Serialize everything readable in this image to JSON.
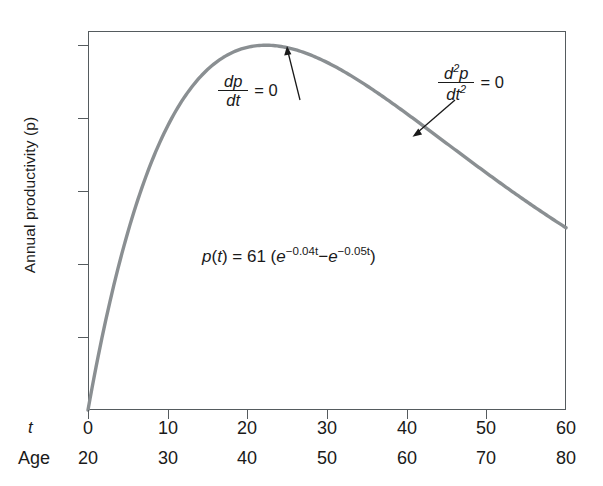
{
  "chart_data": {
    "type": "line",
    "title": "",
    "equation_text": "p(t) = 61 (e^-0.04t - e^-0.05t)",
    "function": "p(t) = 61 (e^(-0.04t) - e^(-0.05t))",
    "ylabel": "Annual productivity (p)",
    "xlabel": "t",
    "secondary_xlabel": "Age",
    "xlim": [
      0,
      60
    ],
    "ylim": [
      0,
      5.3
    ],
    "grid": false,
    "legend": "none",
    "xticks": [
      0,
      10,
      20,
      30,
      40,
      50,
      60
    ],
    "xtick_labels": [
      "0",
      "10",
      "20",
      "30",
      "40",
      "50",
      "60"
    ],
    "secondary_xtick_labels": [
      "20",
      "30",
      "40",
      "50",
      "60",
      "70",
      "80"
    ],
    "yticks": [
      0,
      1,
      2,
      3,
      4,
      5
    ],
    "ytick_labels": [
      "0",
      "1",
      "2",
      "3",
      "4",
      "5"
    ],
    "series": [
      {
        "name": "p(t)",
        "color": "#8a8f92",
        "x": [
          0,
          1,
          2,
          3,
          4,
          5,
          6,
          8,
          10,
          12,
          14,
          16,
          18,
          20,
          22,
          22.31,
          24,
          26,
          28,
          30,
          32,
          34,
          36,
          38,
          40,
          42,
          44,
          46,
          48,
          50,
          52,
          54,
          56,
          58,
          60
        ],
        "values": [
          0,
          0.58,
          1.12,
          1.62,
          2.08,
          2.5,
          2.89,
          3.57,
          4.13,
          4.57,
          4.91,
          5.16,
          5.33,
          5.44,
          5.49,
          5.49,
          5.48,
          5.44,
          5.36,
          5.25,
          5.12,
          4.97,
          4.81,
          4.64,
          4.46,
          4.28,
          4.09,
          3.9,
          3.71,
          3.53,
          3.34,
          3.16,
          2.99,
          2.82,
          2.66
        ]
      }
    ],
    "key_points": {
      "maximum": {
        "t": 22.3,
        "p": 5.0,
        "label": "dp/dt = 0"
      },
      "inflection": {
        "t": 44.6,
        "p": 4.0,
        "label": "d2p/dt2 = 0"
      },
      "start": {
        "t": 0,
        "p": 0
      },
      "end": {
        "t": 60,
        "p": 2.47
      }
    },
    "annotations": [
      {
        "id": "first-derivative",
        "numerator": "dp",
        "denominator": "dt",
        "numerator_exponent": "",
        "denominator_exponent": "",
        "equals": "= 0"
      },
      {
        "id": "second-derivative",
        "numerator": "d",
        "denominator": "dt",
        "numerator_exponent": "2",
        "numerator_tail": "p",
        "denominator_exponent": "2",
        "equals": "= 0"
      }
    ],
    "equation_parts": {
      "lhs_p": "p",
      "lhs_open": "(",
      "lhs_t": "t",
      "lhs_close": ")",
      "equals": "=",
      "coefficient": "61",
      "group_open": "(",
      "e1": "e",
      "exp1": "−0.04t",
      "minus": "−",
      "e2": "e",
      "exp2": "−0.05t",
      "group_close": ")"
    },
    "colors": {
      "curve": "#8a8f92",
      "curve_highlight": "#5a6063",
      "axis": "#555b5e",
      "text": "#1a1a1a",
      "background": "#ffffff"
    }
  }
}
